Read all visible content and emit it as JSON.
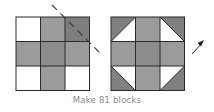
{
  "caption": "Make 81 blocks",
  "colors": {
    "background": "#ffffff",
    "light": "#ffffff",
    "medium": "#9b9b9b",
    "center": "#8c8c8c",
    "dark": "#7e7e7e",
    "corner_triangle": "#808080",
    "grid_line": "#2a2a2a",
    "annotation": "#333333",
    "caption": "#8a8a8a"
  },
  "left_block": {
    "label": "nine-patch before cutting",
    "cells": [
      [
        "light",
        "medium",
        "dark"
      ],
      [
        "medium",
        "center",
        "medium"
      ],
      [
        "light",
        "medium",
        "light"
      ]
    ]
  },
  "right_block": {
    "label": "finished shoo-fly block",
    "cells": [
      [
        "corner",
        "medium",
        "corner"
      ],
      [
        "medium",
        "center",
        "medium"
      ],
      [
        "corner",
        "medium",
        "corner"
      ]
    ]
  },
  "annotations": {
    "cut_line": "dashed diagonal",
    "arrow": "rotate arrow"
  }
}
